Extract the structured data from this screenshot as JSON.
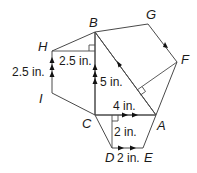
{
  "diagram": {
    "type": "geometry",
    "colors": {
      "trapezoid_left": "#f6d69b",
      "quad_top": "#9ed4c6",
      "triangle": "#c9a3c3",
      "trapezoid_bottom": "#cfe3f4",
      "stroke": "#4a4a4a"
    },
    "vertices": {
      "A": "A",
      "B": "B",
      "C": "C",
      "D": "D",
      "E": "E",
      "F": "F",
      "G": "G",
      "H": "H",
      "I": "I"
    },
    "measurements": {
      "HI": "2.5 in.",
      "H_height": "2.5 in.",
      "BC": "5 in.",
      "CA": "4 in.",
      "height_bottom": "2 in.",
      "DE": "2 in."
    }
  }
}
